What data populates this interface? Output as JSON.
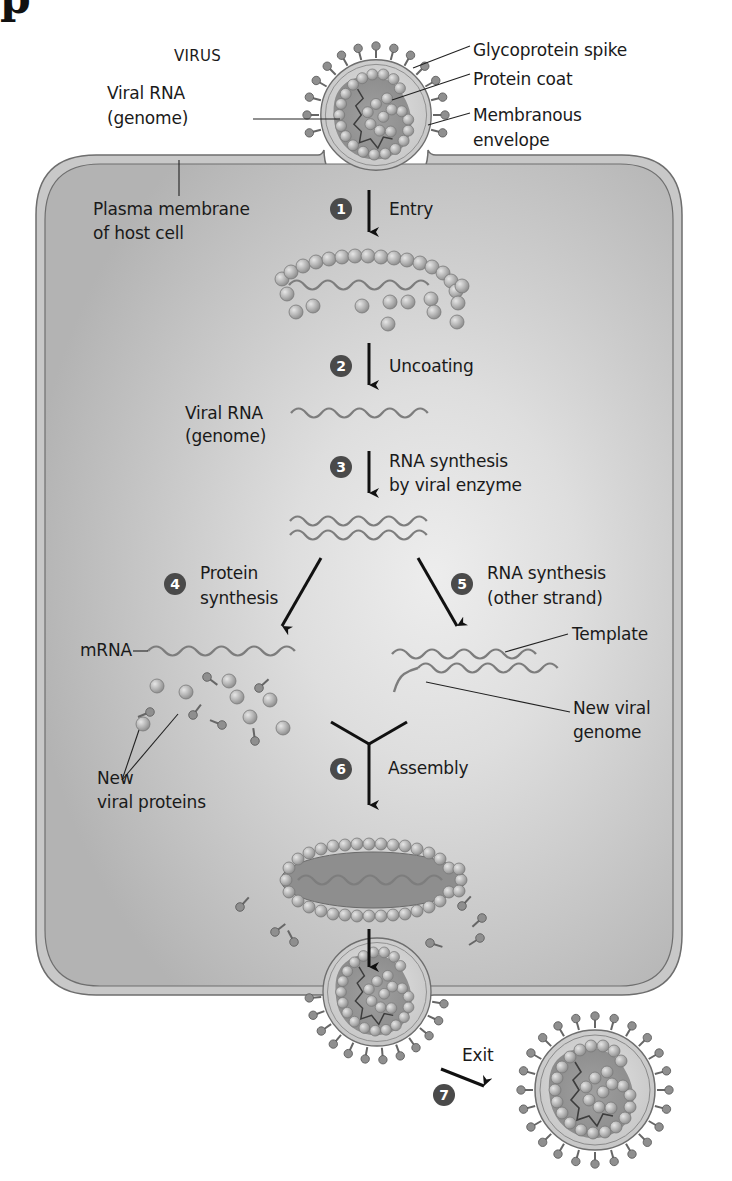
{
  "figure": {
    "heading_fragment": "p",
    "title_label": "VIRUS",
    "colors": {
      "cell_fill": "#b9b9b9",
      "cell_highlight": "#ececec",
      "membrane": "#c8c8c8",
      "membrane_line": "#6e6e6e",
      "capsomere": "#b4b4b4",
      "capsomere_edge": "#7a7a7a",
      "rna": "#7d7d7d",
      "step_badge": "#4a4a4a",
      "arrow": "#111111",
      "text": "#1a1a1a"
    }
  },
  "labels": {
    "glycoprotein_spike": "Glycoprotein spike",
    "protein_coat": "Protein coat",
    "viral_rna_genome_top_1": "Viral RNA",
    "viral_rna_genome_top_2": "(genome)",
    "membranous_envelope_1": "Membranous",
    "membranous_envelope_2": "envelope",
    "plasma_membrane_1": "Plasma membrane",
    "plasma_membrane_2": "of host cell",
    "viral_rna_mid_1": "Viral RNA",
    "viral_rna_mid_2": "(genome)",
    "mrna": "mRNA",
    "template": "Template",
    "new_viral_genome_1": "New viral",
    "new_viral_genome_2": "genome",
    "new_viral_proteins_1": "New",
    "new_viral_proteins_2": "viral proteins"
  },
  "steps": [
    {
      "number": "1",
      "label_1": "Entry",
      "label_2": ""
    },
    {
      "number": "2",
      "label_1": "Uncoating",
      "label_2": ""
    },
    {
      "number": "3",
      "label_1": "RNA synthesis",
      "label_2": "by viral enzyme"
    },
    {
      "number": "4",
      "label_1": "Protein",
      "label_2": "synthesis"
    },
    {
      "number": "5",
      "label_1": "RNA synthesis",
      "label_2": "(other strand)"
    },
    {
      "number": "6",
      "label_1": "Assembly",
      "label_2": ""
    },
    {
      "number": "7",
      "label_1": "Exit",
      "label_2": ""
    }
  ]
}
